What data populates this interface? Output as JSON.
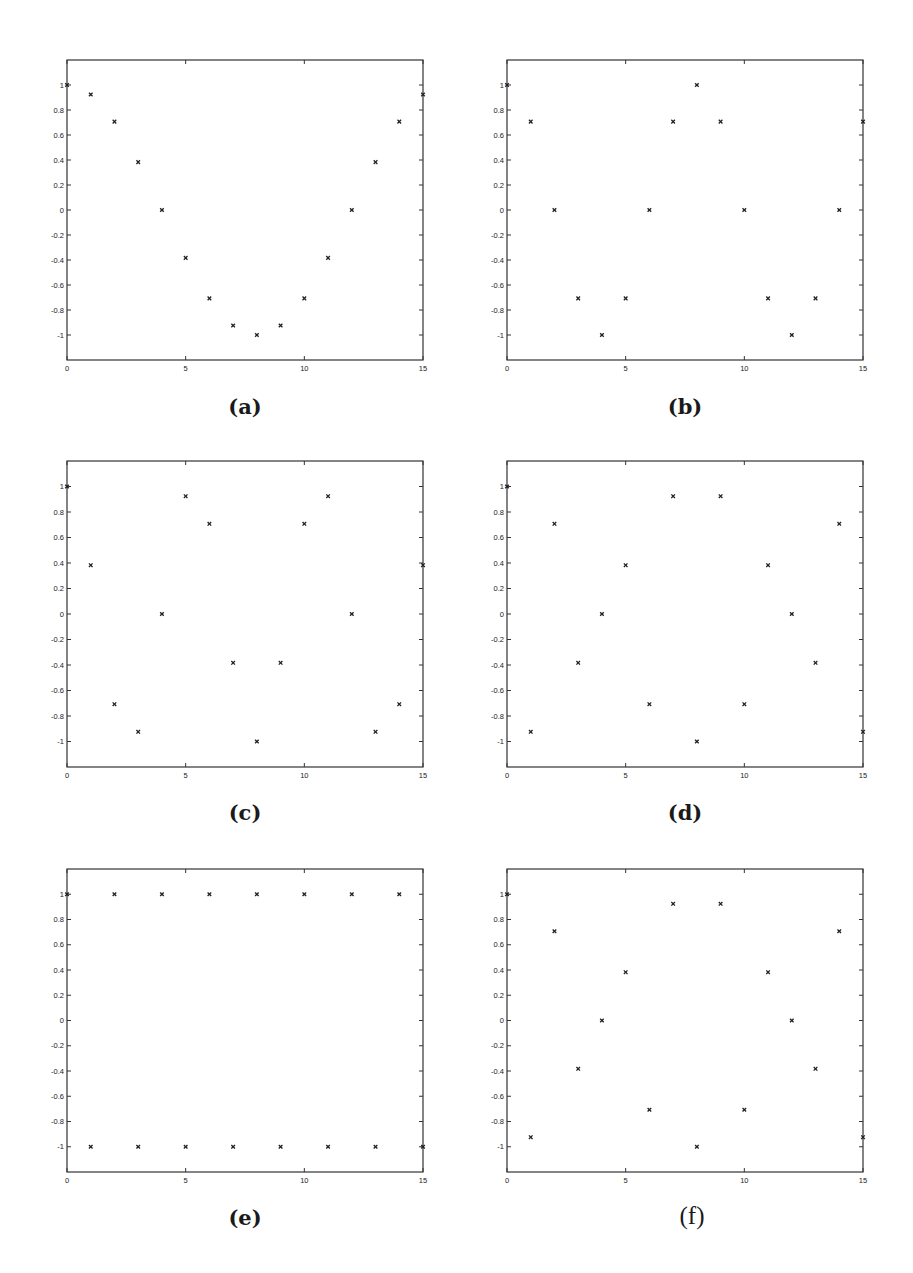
{
  "figure": {
    "style": {
      "frame_color": "#333333",
      "marker_color": "#222222",
      "background": "#ffffff"
    }
  },
  "chart_data": [
    {
      "id": "a",
      "type": "scatter",
      "caption": "(a)",
      "caption_bold": true,
      "x": [
        0,
        1,
        2,
        3,
        4,
        5,
        6,
        7,
        8,
        9,
        10,
        11,
        12,
        13,
        14,
        15
      ],
      "values": [
        1,
        0.924,
        0.707,
        0.383,
        0,
        -0.383,
        -0.707,
        -0.924,
        -1,
        -0.924,
        -0.707,
        -0.383,
        0,
        0.383,
        0.707,
        0.924
      ],
      "xlim": [
        0,
        15
      ],
      "ylim": [
        -1.2,
        1.2
      ],
      "xticks": [
        0,
        5,
        10,
        15
      ],
      "xtick_labels": [
        "0",
        "5",
        "10",
        "15"
      ],
      "yticks": [
        1,
        0.8,
        0.6,
        0.4,
        0.2,
        0,
        -0.2,
        -0.4,
        -0.6,
        -0.8,
        -1
      ],
      "ytick_labels": [
        "1",
        "0.8",
        "0.6",
        "0.4",
        "0.2",
        "0",
        "-0.2",
        "-0.4",
        "-0.6",
        "-0.8",
        "-1"
      ],
      "marker": "x",
      "grid": false,
      "title": "",
      "xlabel": "",
      "ylabel": ""
    },
    {
      "id": "b",
      "type": "scatter",
      "caption": "(b)",
      "caption_bold": true,
      "x": [
        0,
        1,
        2,
        3,
        4,
        5,
        6,
        7,
        8,
        9,
        10,
        11,
        12,
        13,
        14,
        15
      ],
      "values": [
        1,
        0.707,
        0,
        -0.707,
        -1,
        -0.707,
        0,
        0.707,
        1,
        0.707,
        0,
        -0.707,
        -1,
        -0.707,
        0,
        0.707
      ],
      "xlim": [
        0,
        15
      ],
      "ylim": [
        -1.2,
        1.2
      ],
      "xticks": [
        0,
        5,
        10,
        15
      ],
      "xtick_labels": [
        "0",
        "5",
        "10",
        "15"
      ],
      "yticks": [
        1,
        0.8,
        0.6,
        0.4,
        0.2,
        0,
        -0.2,
        -0.4,
        -0.6,
        -0.8,
        -1
      ],
      "ytick_labels": [
        "1",
        "0.8",
        "0.6",
        "0.4",
        "0.2",
        "0",
        "-0.2",
        "-0.4",
        "-0.6",
        "-0.8",
        "-1"
      ],
      "marker": "x",
      "grid": false,
      "title": "",
      "xlabel": "",
      "ylabel": ""
    },
    {
      "id": "c",
      "type": "scatter",
      "caption": "(c)",
      "caption_bold": true,
      "x": [
        0,
        1,
        2,
        3,
        4,
        5,
        6,
        7,
        8,
        9,
        10,
        11,
        12,
        13,
        14,
        15
      ],
      "values": [
        1,
        0.383,
        -0.707,
        -0.924,
        0,
        0.924,
        0.707,
        -0.383,
        -1,
        -0.383,
        0.707,
        0.924,
        0,
        -0.924,
        -0.707,
        0.383
      ],
      "xlim": [
        0,
        15
      ],
      "ylim": [
        -1.2,
        1.2
      ],
      "xticks": [
        0,
        5,
        10,
        15
      ],
      "xtick_labels": [
        "0",
        "5",
        "10",
        "15"
      ],
      "yticks": [
        1,
        0.8,
        0.6,
        0.4,
        0.2,
        0,
        -0.2,
        -0.4,
        -0.6,
        -0.8,
        -1
      ],
      "ytick_labels": [
        "1",
        "0.8",
        "0.6",
        "0.4",
        "0.2",
        "0",
        "-0.2",
        "-0.4",
        "-0.6",
        "-0.8",
        "-1"
      ],
      "marker": "x",
      "grid": false,
      "title": "",
      "xlabel": "",
      "ylabel": ""
    },
    {
      "id": "d",
      "type": "scatter",
      "caption": "(d)",
      "caption_bold": true,
      "x": [
        0,
        1,
        2,
        3,
        4,
        5,
        6,
        7,
        8,
        9,
        10,
        11,
        12,
        13,
        14,
        15
      ],
      "values": [
        1,
        -0.924,
        0.707,
        -0.383,
        0,
        0.383,
        -0.707,
        0.924,
        -1,
        0.924,
        -0.707,
        0.383,
        0,
        -0.383,
        0.707,
        -0.924
      ],
      "xlim": [
        0,
        15
      ],
      "ylim": [
        -1.2,
        1.2
      ],
      "xticks": [
        0,
        5,
        10,
        15
      ],
      "xtick_labels": [
        "0",
        "5",
        "10",
        "15"
      ],
      "yticks": [
        1,
        0.8,
        0.6,
        0.4,
        0.2,
        0,
        -0.2,
        -0.4,
        -0.6,
        -0.8,
        -1
      ],
      "ytick_labels": [
        "1",
        "0.8",
        "0.6",
        "0.4",
        "0.2",
        "0",
        "-0.2",
        "-0.4",
        "-0.6",
        "-0.8",
        "-1"
      ],
      "marker": "x",
      "grid": false,
      "title": "",
      "xlabel": "",
      "ylabel": ""
    },
    {
      "id": "e",
      "type": "scatter",
      "caption": "(e)",
      "caption_bold": true,
      "x": [
        0,
        1,
        2,
        3,
        4,
        5,
        6,
        7,
        8,
        9,
        10,
        11,
        12,
        13,
        14,
        15
      ],
      "values": [
        1,
        -1,
        1,
        -1,
        1,
        -1,
        1,
        -1,
        1,
        -1,
        1,
        -1,
        1,
        -1,
        1,
        -1
      ],
      "xlim": [
        0,
        15
      ],
      "ylim": [
        -1.2,
        1.2
      ],
      "xticks": [
        0,
        5,
        10,
        15
      ],
      "xtick_labels": [
        "0",
        "5",
        "10",
        "15"
      ],
      "yticks": [
        1,
        0.8,
        0.6,
        0.4,
        0.2,
        0,
        -0.2,
        -0.4,
        -0.6,
        -0.8,
        -1
      ],
      "ytick_labels": [
        "1",
        "0.8",
        "0.6",
        "0.4",
        "0.2",
        "0",
        "-0.2",
        "-0.4",
        "-0.6",
        "-0.8",
        "-1"
      ],
      "marker": "x",
      "grid": false,
      "title": "",
      "xlabel": "",
      "ylabel": ""
    },
    {
      "id": "f",
      "type": "scatter",
      "caption": "(f)",
      "caption_bold": false,
      "x": [
        0,
        1,
        2,
        3,
        4,
        5,
        6,
        7,
        8,
        9,
        10,
        11,
        12,
        13,
        14,
        15
      ],
      "values": [
        1,
        -0.924,
        0.707,
        -0.383,
        0,
        0.383,
        -0.707,
        0.924,
        -1,
        0.924,
        -0.707,
        0.383,
        0,
        -0.383,
        0.707,
        -0.924
      ],
      "xlim": [
        0,
        15
      ],
      "ylim": [
        -1.2,
        1.2
      ],
      "xticks": [
        0,
        5,
        10,
        15
      ],
      "xtick_labels": [
        "0",
        "5",
        "10",
        "15"
      ],
      "yticks": [
        1,
        0.8,
        0.6,
        0.4,
        0.2,
        0,
        -0.2,
        -0.4,
        -0.6,
        -0.8,
        -1
      ],
      "ytick_labels": [
        "1",
        "0.8",
        "0.6",
        "0.4",
        "0.2",
        "0",
        "-0.2",
        "-0.4",
        "-0.6",
        "-0.8",
        "-1"
      ],
      "marker": "x",
      "grid": false,
      "title": "",
      "xlabel": "",
      "ylabel": ""
    }
  ]
}
